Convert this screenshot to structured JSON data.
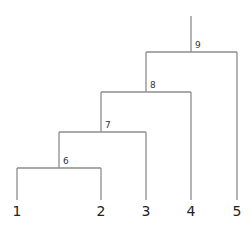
{
  "diagram": {
    "type": "dendrogram",
    "line_color": "#8c8c8c",
    "leaves": [
      {
        "id": "1",
        "label": "1",
        "x": 17
      },
      {
        "id": "2",
        "label": "2",
        "x": 101
      },
      {
        "id": "3",
        "label": "3",
        "x": 146
      },
      {
        "id": "4",
        "label": "4",
        "x": 191
      },
      {
        "id": "5",
        "label": "5",
        "x": 237
      }
    ],
    "internal_nodes": [
      {
        "id": "6",
        "label": "6",
        "children": [
          "1",
          "2"
        ],
        "x": 59,
        "y": 168
      },
      {
        "id": "7",
        "label": "7",
        "children": [
          "6",
          "3"
        ],
        "x": 101,
        "y": 132
      },
      {
        "id": "8",
        "label": "8",
        "children": [
          "7",
          "4"
        ],
        "x": 146,
        "y": 92
      },
      {
        "id": "9",
        "label": "9",
        "children": [
          "8",
          "5"
        ],
        "x": 191,
        "y": 52
      }
    ],
    "root_top_y": 16,
    "leaf_bottom_y": 200,
    "leaf_label_y": 215
  }
}
